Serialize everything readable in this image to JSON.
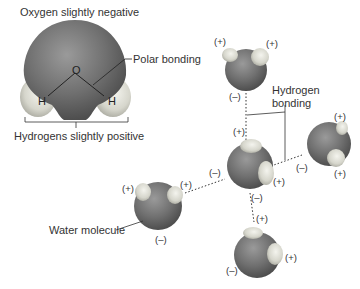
{
  "labels": {
    "oxygen": "Oxygen slightly negative",
    "polar": "Polar bonding",
    "hydrogens": "Hydrogens slightly positive",
    "hbond_line1": "Hydrogen",
    "hbond_line2": "bonding",
    "water": "Water molecule"
  },
  "atoms": {
    "O": "O",
    "H1": "H",
    "H2": "H"
  },
  "charges": {
    "plus": "(+)",
    "minus": "(–)"
  },
  "colors": {
    "oxygen": "#6e6e6e",
    "hydrogen": "#dcdcd4",
    "line": "#333333"
  }
}
